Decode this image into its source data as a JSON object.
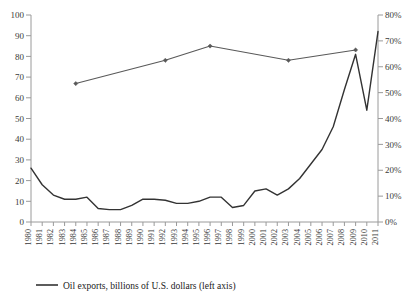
{
  "chart_data": {
    "type": "line",
    "title": "",
    "xlabel": "",
    "ylabel": "",
    "grid": false,
    "legend_position": "bottom-left",
    "x": [
      1980,
      1981,
      1982,
      1983,
      1984,
      1985,
      1986,
      1987,
      1988,
      1989,
      1990,
      1991,
      1992,
      1993,
      1994,
      1995,
      1996,
      1997,
      1998,
      1999,
      2000,
      2001,
      2002,
      2003,
      2004,
      2005,
      2006,
      2007,
      2008,
      2009,
      2010,
      2011
    ],
    "categories": [
      "1980",
      "1981",
      "1982",
      "1983",
      "1984",
      "1985",
      "1986",
      "1987",
      "1988",
      "1989",
      "1990",
      "1991",
      "1992",
      "1993",
      "1994",
      "1995",
      "1996",
      "1997",
      "1998",
      "1999",
      "2000",
      "2001",
      "2002",
      "2003",
      "2004",
      "2005",
      "2006",
      "2007",
      "2008",
      "2009",
      "2010",
      "2011"
    ],
    "left_axis": {
      "label": "",
      "ylim": [
        0,
        100
      ],
      "ticks": [
        0,
        10,
        20,
        30,
        40,
        50,
        60,
        70,
        80,
        90,
        100
      ],
      "tick_labels": [
        "0",
        "10",
        "20",
        "30",
        "40",
        "50",
        "60",
        "70",
        "80",
        "90",
        "100"
      ]
    },
    "right_axis": {
      "label": "",
      "ylim": [
        0,
        80
      ],
      "ticks": [
        0,
        10,
        20,
        30,
        40,
        50,
        60,
        70,
        80
      ],
      "tick_labels": [
        "0%",
        "10%",
        "20%",
        "30%",
        "40%",
        "50%",
        "60%",
        "70%",
        "80%"
      ]
    },
    "series": [
      {
        "name": "Oil exports, billions of U.S. dollars (left axis)",
        "axis": "left",
        "color": "#333333",
        "marker": "none",
        "values": [
          26,
          18,
          13,
          11,
          11,
          12,
          6.5,
          6,
          6,
          8,
          11,
          11,
          10.5,
          9,
          9,
          10,
          12,
          12,
          7,
          8,
          15,
          16,
          13,
          16,
          21,
          28,
          35,
          46,
          64,
          81,
          54,
          92
        ]
      },
      {
        "name": "Oil exports share (right axis)",
        "axis": "right",
        "color": "#595959",
        "marker": "diamond",
        "values": [
          null,
          null,
          null,
          null,
          53.5,
          null,
          null,
          null,
          null,
          null,
          null,
          null,
          62.5,
          null,
          null,
          null,
          68,
          null,
          null,
          null,
          null,
          null,
          null,
          62.5,
          null,
          null,
          null,
          null,
          null,
          66.5,
          null,
          null
        ]
      }
    ],
    "legend": [
      {
        "label": "Oil exports, billions of U.S. dollars (left axis)",
        "color": "#333333",
        "style": "line"
      }
    ]
  }
}
